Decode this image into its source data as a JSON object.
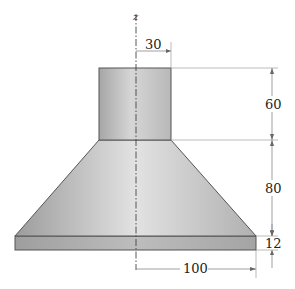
{
  "figure": {
    "axis_label": "z",
    "dimensions": {
      "top_radius": "30",
      "cylinder_height": "60",
      "cone_height": "80",
      "base_thickness": "12",
      "base_radius": "100"
    },
    "colors": {
      "body_light": "#dcdcdc",
      "body_dark": "#9a9a9a",
      "base_face": "#a8a8a8",
      "base_top": "#c4c4c4"
    }
  }
}
